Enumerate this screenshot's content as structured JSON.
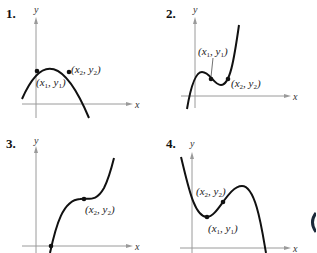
{
  "panels": [
    {
      "number": "1.",
      "x_label": "x",
      "y_label": "y",
      "curve": "downward parabola",
      "points": [
        {
          "label_x": "x",
          "sub_x": "1",
          "label_y": "y",
          "sub_y": "1"
        },
        {
          "label_x": "x",
          "sub_x": "2",
          "label_y": "y",
          "sub_y": "2"
        }
      ]
    },
    {
      "number": "2.",
      "x_label": "x",
      "y_label": "y",
      "curve": "cubic with local max then local min",
      "points": [
        {
          "label_x": "x",
          "sub_x": "1",
          "label_y": "y",
          "sub_y": "1"
        },
        {
          "label_x": "x",
          "sub_x": "2",
          "label_y": "y",
          "sub_y": "2"
        }
      ]
    },
    {
      "number": "3.",
      "x_label": "x",
      "y_label": "y",
      "curve": "increasing cubic with plateau",
      "points": [
        {
          "label_x": "x",
          "sub_x": "2",
          "label_y": "y",
          "sub_y": "2"
        }
      ]
    },
    {
      "number": "4.",
      "x_label": "x",
      "y_label": "y",
      "curve": "cubic with local min then local max",
      "points": [
        {
          "label_x": "x",
          "sub_x": "2",
          "label_y": "y",
          "sub_y": "2"
        },
        {
          "label_x": "x",
          "sub_x": "1",
          "label_y": "y",
          "sub_y": "1"
        }
      ]
    }
  ]
}
